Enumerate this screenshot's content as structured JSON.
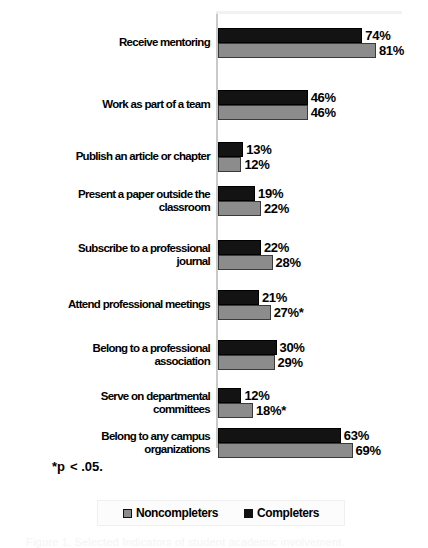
{
  "chart_data": {
    "type": "bar",
    "orientation": "horizontal",
    "title": "",
    "xlabel": "",
    "ylabel": "",
    "xlim": [
      0,
      100
    ],
    "grid": false,
    "legend_position": "bottom",
    "categories": [
      "Receive mentoring",
      "Work as part of a team",
      "Publish an article or chapter",
      "Present a paper outside the\nclassroom",
      "Subscribe to a professional\njournal",
      "Attend professional meetings",
      "Belong to a professional\nassociation",
      "Serve on departmental\ncommittees",
      "Belong to any campus\norganizations"
    ],
    "series": [
      {
        "name": "Completers",
        "color": "#131313",
        "values": [
          74,
          46,
          13,
          19,
          22,
          21,
          30,
          12,
          63
        ],
        "labels": [
          "74%",
          "46%",
          "13%",
          "19%",
          "22%",
          "21%",
          "30%",
          "12%",
          "63%"
        ]
      },
      {
        "name": "Noncompleters",
        "color": "#8c8c8c",
        "values": [
          81,
          46,
          12,
          22,
          28,
          27,
          29,
          18,
          69
        ],
        "labels": [
          "81%",
          "46%",
          "12%",
          "22%",
          "28%",
          "27%*",
          "29%",
          "18%*",
          "69%"
        ]
      }
    ],
    "annotations": [
      "*p  < .05."
    ]
  },
  "rows": [
    {
      "label_line1": "Receive mentoring",
      "label_line2": "",
      "completers_value": 74,
      "completers_label": "74%",
      "noncompleters_value": 81,
      "noncompleters_label": "81%"
    },
    {
      "label_line1": "Work as part of a team",
      "label_line2": "",
      "completers_value": 46,
      "completers_label": "46%",
      "noncompleters_value": 46,
      "noncompleters_label": "46%"
    },
    {
      "label_line1": "Publish an article or chapter",
      "label_line2": "",
      "completers_value": 13,
      "completers_label": "13%",
      "noncompleters_value": 12,
      "noncompleters_label": "12%"
    },
    {
      "label_line1": "Present a paper outside the",
      "label_line2": "classroom",
      "completers_value": 19,
      "completers_label": "19%",
      "noncompleters_value": 22,
      "noncompleters_label": "22%"
    },
    {
      "label_line1": "Subscribe to a professional",
      "label_line2": "journal",
      "completers_value": 22,
      "completers_label": "22%",
      "noncompleters_value": 28,
      "noncompleters_label": "28%"
    },
    {
      "label_line1": "Attend professional meetings",
      "label_line2": "",
      "completers_value": 21,
      "completers_label": "21%",
      "noncompleters_value": 27,
      "noncompleters_label": "27%*"
    },
    {
      "label_line1": "Belong to a professional",
      "label_line2": "association",
      "completers_value": 30,
      "completers_label": "30%",
      "noncompleters_value": 29,
      "noncompleters_label": "29%"
    },
    {
      "label_line1": "Serve on departmental",
      "label_line2": "committees",
      "completers_value": 12,
      "completers_label": "12%",
      "noncompleters_value": 18,
      "noncompleters_label": "18%*"
    },
    {
      "label_line1": "Belong to any campus",
      "label_line2": "organizations",
      "completers_value": 63,
      "completers_label": "63%",
      "noncompleters_value": 69,
      "noncompleters_label": "69%"
    }
  ],
  "footnote": {
    "marker": "*",
    "text": "p",
    "comparison": "< .05."
  },
  "legend": {
    "items": [
      {
        "label": "Noncompleters",
        "swatch": "noncompleters-swatch"
      },
      {
        "label": "Completers",
        "swatch": "completers-swatch"
      }
    ]
  },
  "caption_ghost": "Figure 1.  Selected Indicators of student academic involvement."
}
